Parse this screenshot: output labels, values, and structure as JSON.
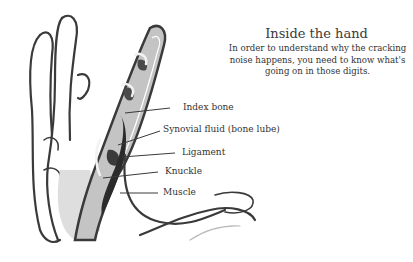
{
  "heading": {
    "title": "Inside the hand",
    "description": "In order to understand why the cracking noise happens, you need to know what's going on in those digits."
  },
  "labels": [
    {
      "id": "index-bone",
      "text": "Index bone"
    },
    {
      "id": "synovial-fluid",
      "text": "Synovial fluid (bone lube)"
    },
    {
      "id": "ligament",
      "text": "Ligament"
    },
    {
      "id": "knuckle",
      "text": "Knuckle"
    },
    {
      "id": "muscle",
      "text": "Muscle"
    }
  ],
  "colors": {
    "outline": "#3a3a3a",
    "bone": "#bdbdbd",
    "shadow": "#dedede",
    "dark": "#2b2b2b"
  }
}
